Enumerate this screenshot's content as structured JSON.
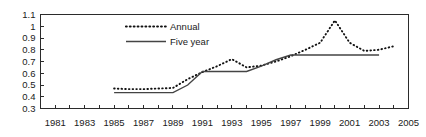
{
  "chart_data": {
    "type": "line",
    "title": "",
    "xlabel": "",
    "ylabel": "",
    "xlim": [
      1980,
      2005
    ],
    "ylim": [
      0.3,
      1.1
    ],
    "grid": false,
    "legend_position": "top-center",
    "y_ticks": [
      "1.1",
      "1",
      "0.9",
      "0.8",
      "0.7",
      "0.6",
      "0.5",
      "0.4",
      "0.3"
    ],
    "y_tick_values": [
      1.1,
      1.0,
      0.9,
      0.8,
      0.7,
      0.6,
      0.5,
      0.4,
      0.3
    ],
    "x_ticks": [
      "1981",
      "1983",
      "1985",
      "1987",
      "1989",
      "1991",
      "1993",
      "1995",
      "1997",
      "1999",
      "2001",
      "2003",
      "2005"
    ],
    "x_tick_values": [
      1981,
      1983,
      1985,
      1987,
      1989,
      1991,
      1993,
      1995,
      1997,
      1999,
      2001,
      2003,
      2005
    ],
    "x_minor_ticks": [
      1980,
      1981,
      1982,
      1983,
      1984,
      1985,
      1986,
      1987,
      1988,
      1989,
      1990,
      1991,
      1992,
      1993,
      1994,
      1995,
      1996,
      1997,
      1998,
      1999,
      2000,
      2001,
      2002,
      2003,
      2004,
      2005
    ],
    "series": [
      {
        "name": "Annual",
        "style": "dotted",
        "color": "#111111",
        "x": [
          1985,
          1986,
          1987,
          1988,
          1989,
          1990,
          1991,
          1992,
          1993,
          1994,
          1995,
          1996,
          1997,
          1998,
          1999,
          2000,
          2001,
          2002,
          2003,
          2004
        ],
        "values": [
          0.47,
          0.465,
          0.465,
          0.47,
          0.475,
          0.55,
          0.61,
          0.66,
          0.72,
          0.65,
          0.665,
          0.7,
          0.745,
          0.8,
          0.86,
          1.05,
          0.86,
          0.79,
          0.8,
          0.83
        ]
      },
      {
        "name": "Five year",
        "style": "solid",
        "color": "#444444",
        "x": [
          1985,
          1989,
          1990,
          1991,
          1993,
          1994,
          1995,
          1996,
          1997,
          2003
        ],
        "values": [
          0.435,
          0.435,
          0.5,
          0.615,
          0.615,
          0.615,
          0.66,
          0.715,
          0.755,
          0.755
        ]
      }
    ],
    "legend": [
      {
        "label": "Annual",
        "style": "dotted",
        "color": "#111111"
      },
      {
        "label": "Five year",
        "style": "solid",
        "color": "#444444"
      }
    ],
    "colors": {
      "axis": "#2b2b2b",
      "annual": "#111111",
      "five_year": "#444444",
      "background": "#ffffff",
      "text": "#1a1a1a"
    }
  }
}
